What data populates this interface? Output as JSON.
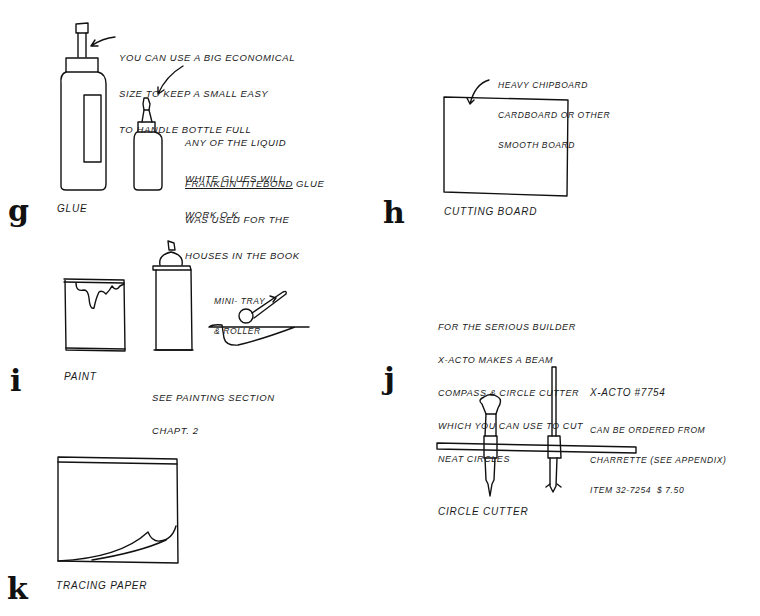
{
  "page": {
    "sections": [
      {
        "id": "g",
        "letter": "g",
        "caption": "Glue",
        "notes": [
          "You can use a big economical",
          "size to keep a small easy",
          "to handle bottle full"
        ],
        "notes2": [
          "Any of the liquid",
          "white glues will",
          "work o.k."
        ],
        "brand_underlined": "Franklin Titebond",
        "brand_suffix": " glue",
        "notes3": [
          "was used for the",
          "houses in the book"
        ]
      },
      {
        "id": "h",
        "letter": "h",
        "caption": "Cutting board",
        "notes": [
          "Heavy chipboard",
          "cardboard or other",
          "smooth board"
        ]
      },
      {
        "id": "i",
        "letter": "i",
        "caption": "Paint",
        "caption2": [
          "See painting section",
          "chapt. 2"
        ],
        "notes": [
          "Mini- tray",
          "& roller"
        ]
      },
      {
        "id": "j",
        "letter": "j",
        "caption": "Circle cutter",
        "notes": [
          "For the serious builder",
          "X-Acto makes a beam",
          "compass & circle cutter",
          "which you can use to cut",
          "neat circles"
        ],
        "product": "X-Acto #7754",
        "order_notes": [
          "Can be ordered from",
          "Charrette (see appendix)",
          "Item 32-7254  $ 7.50"
        ]
      },
      {
        "id": "k",
        "letter": "k",
        "caption": "Tracing paper"
      }
    ]
  }
}
